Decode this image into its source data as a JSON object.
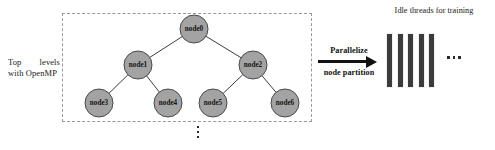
{
  "diagram": {
    "left_caption": {
      "line1_word1": "Top",
      "line1_word2": "levels",
      "line2": "with OpenMP"
    },
    "tree": {
      "nodes": [
        {
          "id": "node0",
          "label": "node0",
          "cx": 194,
          "cy": 29,
          "r": 14
        },
        {
          "id": "node1",
          "label": "node1",
          "cx": 138,
          "cy": 65,
          "r": 14
        },
        {
          "id": "node2",
          "label": "node2",
          "cx": 253,
          "cy": 65,
          "r": 14
        },
        {
          "id": "node3",
          "label": "node3",
          "cx": 99,
          "cy": 103,
          "r": 14
        },
        {
          "id": "node4",
          "label": "node4",
          "cx": 168,
          "cy": 103,
          "r": 14
        },
        {
          "id": "node5",
          "label": "node5",
          "cx": 213,
          "cy": 103,
          "r": 14
        },
        {
          "id": "node6",
          "label": "node6",
          "cx": 285,
          "cy": 103,
          "r": 14
        }
      ],
      "edges": [
        {
          "from": "node0",
          "to": "node1"
        },
        {
          "from": "node0",
          "to": "node2"
        },
        {
          "from": "node1",
          "to": "node3"
        },
        {
          "from": "node1",
          "to": "node4"
        },
        {
          "from": "node2",
          "to": "node5"
        },
        {
          "from": "node2",
          "to": "node6"
        }
      ],
      "continuation_marker": "vertical-ellipsis",
      "node_fill_color": "#a3a3a3",
      "node_stroke_color": "#4a4a4a",
      "region_border_style": "dashed",
      "region_border_color": "#9a9a9a"
    },
    "arrow": {
      "label_top": "Parallelize",
      "label_bottom": "node partition",
      "direction": "right",
      "color": "#111111"
    },
    "threads": {
      "title": "Idle threads for training",
      "count": 5,
      "bars": [
        "thread-1",
        "thread-2",
        "thread-3",
        "thread-4",
        "thread-5"
      ],
      "continuation_marker": "horizontal-ellipsis",
      "bar_color": "#3b3b3b"
    }
  }
}
